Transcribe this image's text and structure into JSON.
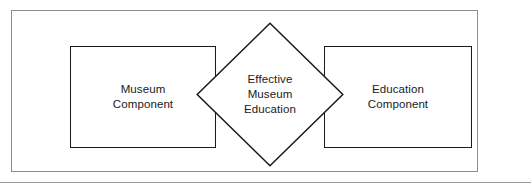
{
  "figure": {
    "name": "effective-museum-education-diagram",
    "type": "diagram",
    "width": 531,
    "height": 193,
    "background_color": "#ffffff"
  },
  "outer_frame": {
    "border_color": "#8c8c8c",
    "border_width": 1
  },
  "nodes": {
    "left_box": {
      "label": "Museum\nComponent",
      "shape": "rectangle",
      "border_color": "#1a1a1a",
      "fill_color": "#ffffff"
    },
    "center_diamond": {
      "label": "Effective\nMuseum\nEducation",
      "shape": "diamond",
      "border_color": "#1a1a1a",
      "fill_color": "#ffffff"
    },
    "right_box": {
      "label": "Education\nComponent",
      "shape": "rectangle",
      "border_color": "#1a1a1a",
      "fill_color": "#ffffff"
    }
  },
  "bottom_rule": {
    "color": "#9a9a9a"
  }
}
